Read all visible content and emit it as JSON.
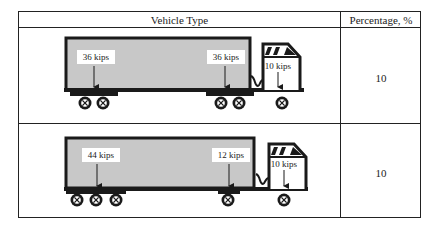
{
  "table": {
    "headers": [
      "Vehicle Type",
      "Percentage, %"
    ],
    "rows": [
      {
        "vehicle": "tractor-trailer with two tandem axles",
        "loads": [
          "36 kips",
          "36 kips",
          "10 kips"
        ],
        "percentage": "10"
      },
      {
        "vehicle": "tractor-trailer with tridem rear axle",
        "loads": [
          "44 kips",
          "12 kips",
          "10 kips"
        ],
        "percentage": "10"
      }
    ]
  },
  "colors": {
    "trailer_fill": "#c8c8c8",
    "outline": "#1a1a1a",
    "label_bg": "#ffffff"
  }
}
